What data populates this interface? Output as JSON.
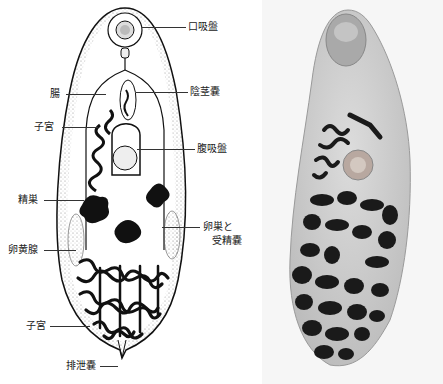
{
  "figure": {
    "left_panel": {
      "type": "line-drawing",
      "subject": "fluke anatomy",
      "labels": [
        {
          "id": "oral-sucker",
          "text": "口吸盤",
          "side": "right"
        },
        {
          "id": "intestine",
          "text": "腸",
          "side": "left"
        },
        {
          "id": "cirrus-sac",
          "text": "陰茎嚢",
          "side": "right"
        },
        {
          "id": "uterus-upper",
          "text": "子宮",
          "side": "left"
        },
        {
          "id": "ventral-sucker",
          "text": "腹吸盤",
          "side": "right"
        },
        {
          "id": "testis",
          "text": "精巣",
          "side": "left"
        },
        {
          "id": "ovary-receptaculum-1",
          "text": "卵巣と",
          "side": "right"
        },
        {
          "id": "ovary-receptaculum-2",
          "text": "受精嚢",
          "side": "right"
        },
        {
          "id": "vitelline-gland",
          "text": "卵黄腺",
          "side": "left"
        },
        {
          "id": "uterus-lower",
          "text": "子宮",
          "side": "left"
        },
        {
          "id": "excretory-bladder",
          "text": "排泄嚢",
          "side": "left"
        }
      ]
    },
    "right_panel": {
      "type": "photomicrograph",
      "subject": "stained fluke specimen"
    },
    "colors": {
      "ink": "#111111",
      "stipple": "#888888",
      "photo_bg": "#f4f4f4",
      "photo_body": "#cfcfcf",
      "photo_dark": "#1a1a1a"
    }
  }
}
